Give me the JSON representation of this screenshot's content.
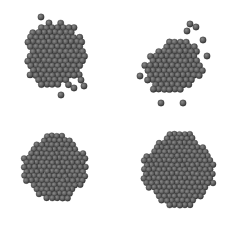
{
  "background": "#ffffff",
  "sphere_colors": {
    "fill": "#5a5a5a",
    "highlight": "#8a8a8a",
    "edge": "#2e2e2e"
  },
  "panels": [
    {
      "id": "cluster-top-left",
      "x": 0,
      "y": 0,
      "shape": "irregular-blob",
      "cx": 55,
      "cy": 55,
      "rx": 30,
      "ry": 32,
      "r": 3.2,
      "extras": [
        [
          41,
          17
        ],
        [
          49,
          23
        ],
        [
          61,
          95
        ],
        [
          81,
          80
        ],
        [
          84,
          86
        ],
        [
          74,
          88
        ]
      ]
    },
    {
      "id": "cluster-top-right",
      "x": 117,
      "y": 0,
      "shape": "irregular-tilted",
      "cx": 56,
      "cy": 68,
      "rx": 28,
      "ry": 26,
      "r": 3.2,
      "extras": [
        [
          73,
          24
        ],
        [
          79,
          27
        ],
        [
          70,
          31
        ],
        [
          23,
          76
        ],
        [
          44,
          103
        ],
        [
          66,
          103
        ],
        [
          86,
          40
        ],
        [
          90,
          56
        ]
      ]
    },
    {
      "id": "cluster-bottom-left",
      "x": 0,
      "y": 113,
      "shape": "faceted-polyhedron",
      "cx": 55,
      "cy": 55,
      "rx": 31,
      "ry": 32,
      "r": 3.0,
      "extras": []
    },
    {
      "id": "cluster-bottom-right",
      "x": 117,
      "y": 113,
      "shape": "faceted-polyhedron",
      "cx": 62,
      "cy": 57,
      "rx": 35,
      "ry": 36,
      "r": 3.0,
      "extras": []
    }
  ]
}
